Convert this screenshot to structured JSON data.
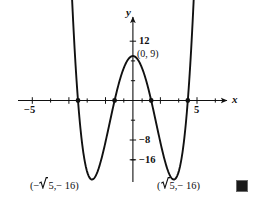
{
  "figure": {
    "background_color": "#ffffff",
    "ink_color": "#111111",
    "end_of_proof_marker": "■"
  },
  "axes": {
    "x_axis_label": "x",
    "y_axis_label": "y",
    "x_ticks_labeled": [
      {
        "value": -5,
        "text": "−5"
      },
      {
        "value": 5,
        "text": "5"
      }
    ],
    "y_ticks_labeled": [
      {
        "value": 12,
        "text": "12"
      },
      {
        "value": -8,
        "text": "−8"
      },
      {
        "value": -16,
        "text": "−16"
      }
    ],
    "xlim": [
      -5.8,
      5.8
    ],
    "ylim": [
      -19,
      15
    ],
    "x_tick_step": 1,
    "y_tick_step": 4,
    "grid": false
  },
  "annotations": {
    "y_intercept": {
      "text": "(0, 9)",
      "x": 0,
      "y": 9
    },
    "left_minimum": {
      "open_paren": "(",
      "sign": "−",
      "radicand": "5",
      "separator": ", ",
      "y_text": "− 16",
      "close_paren": ")",
      "x": -2.236,
      "y": -16
    },
    "right_minimum": {
      "open_paren": "(",
      "sign": "",
      "radicand": "5",
      "separator": ", ",
      "y_text": "− 16",
      "close_paren": ")",
      "x": 2.236,
      "y": -16
    }
  },
  "chart_data": {
    "type": "line",
    "title": "",
    "xlabel": "x",
    "ylabel": "y",
    "xlim": [
      -5.8,
      5.8
    ],
    "ylim": [
      -19,
      15
    ],
    "grid": false,
    "legend": null,
    "function": "y = x^4 - 10x^2 + 9",
    "series": [
      {
        "name": "y = x^4 - 10x^2 + 9",
        "x": [
          -3.45,
          -3.4,
          -3.3,
          -3.2,
          -3.1,
          -3.0,
          -2.9,
          -2.8,
          -2.7,
          -2.6,
          -2.5,
          -2.4,
          -2.3,
          -2.236,
          -2.2,
          -2.1,
          -2.0,
          -1.9,
          -1.8,
          -1.7,
          -1.6,
          -1.5,
          -1.4,
          -1.3,
          -1.2,
          -1.1,
          -1.0,
          -0.9,
          -0.8,
          -0.7,
          -0.6,
          -0.5,
          -0.4,
          -0.3,
          -0.2,
          -0.1,
          0.0,
          0.1,
          0.2,
          0.3,
          0.4,
          0.5,
          0.6,
          0.7,
          0.8,
          0.9,
          1.0,
          1.1,
          1.2,
          1.3,
          1.4,
          1.5,
          1.6,
          1.7,
          1.8,
          1.9,
          2.0,
          2.1,
          2.2,
          2.236,
          2.3,
          2.4,
          2.5,
          2.6,
          2.7,
          2.8,
          2.9,
          3.0,
          3.1,
          3.2,
          3.3,
          3.4,
          3.45
        ],
        "y": [
          22.63,
          17.07,
          9.73,
          3.3,
          -2.26,
          -7.0,
          -10.96,
          -16.0,
          -15.04,
          -16.58,
          -17.44,
          -17.63,
          -17.17,
          -17.0,
          -16.07,
          -14.4,
          -12.0,
          -9.16,
          -5.92,
          -2.34,
          1.53,
          5.69,
          10.1,
          14.74,
          19.6,
          24.67,
          9.0,
          5.44,
          2.62,
          0.52,
          -0.91,
          -1.44,
          -0.59,
          -0.89,
          8.6,
          8.9,
          9.0,
          8.9,
          8.6,
          8.11,
          7.44,
          6.56,
          5.44,
          4.1,
          2.46,
          0.52,
          0.0,
          -2.84,
          -5.92,
          -9.16,
          -12.0,
          -14.4,
          -16.07,
          -17.0,
          -17.63,
          -17.44,
          -16.58,
          -15.04,
          -13.04,
          -12.0,
          -9.73,
          -5.92,
          -2.26,
          1.53,
          5.69,
          10.1,
          14.74,
          0.0,
          3.3,
          9.73,
          17.07,
          22.63,
          26.0
        ]
      }
    ],
    "marked_points": [
      {
        "label": "(0, 9)",
        "x": 0,
        "y": 9
      },
      {
        "label": "(-sqrt(5), -16)",
        "x": -2.236,
        "y": -16
      },
      {
        "label": "(sqrt(5), -16)",
        "x": 2.236,
        "y": -16
      },
      {
        "label": "x-intercept",
        "x": -3,
        "y": 0
      },
      {
        "label": "x-intercept",
        "x": -1,
        "y": 0
      },
      {
        "label": "x-intercept",
        "x": 1,
        "y": 0
      },
      {
        "label": "x-intercept",
        "x": 3,
        "y": 0
      }
    ]
  }
}
